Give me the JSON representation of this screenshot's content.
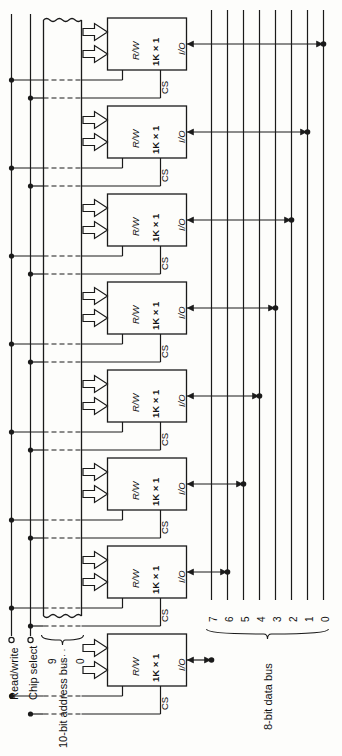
{
  "figure": {
    "orientation": "rotated-90",
    "ink_color": "#1a1a1a",
    "background_color": "#fdfdfb"
  },
  "control_terminals": [
    {
      "id": "read-write",
      "label": "Read/write",
      "terminal": "open-circle"
    },
    {
      "id": "chip-select",
      "label": "Chip select",
      "terminal": "open-circle"
    }
  ],
  "address_bus": {
    "label": "10-bit address bus",
    "width_bits": 10,
    "msb_label": "9",
    "ellipsis_label": "· · · ·",
    "lsb_label": "0",
    "brace": "curly",
    "edge_style": "torn-zigzag"
  },
  "data_bus": {
    "label": "8-bit data bus",
    "width_bits": 8,
    "line_labels": [
      "7",
      "6",
      "5",
      "4",
      "3",
      "2",
      "1",
      "0"
    ],
    "brace": "curly"
  },
  "chips": [
    {
      "index": 1,
      "rw_label": "R/W",
      "size_label": "1K × 1",
      "io_label": "I/O",
      "cs_label": "CS",
      "data_line": "0"
    },
    {
      "index": 2,
      "rw_label": "R/W",
      "size_label": "1K × 1",
      "io_label": "I/O",
      "cs_label": "CS",
      "data_line": "1"
    },
    {
      "index": 3,
      "rw_label": "R/W",
      "size_label": "1K × 1",
      "io_label": "I/O",
      "cs_label": "CS",
      "data_line": "2"
    },
    {
      "index": 4,
      "rw_label": "R/W",
      "size_label": "1K × 1",
      "io_label": "I/O",
      "cs_label": "CS",
      "data_line": "3"
    },
    {
      "index": 5,
      "rw_label": "R/W",
      "size_label": "1K × 1",
      "io_label": "I/O",
      "cs_label": "CS",
      "data_line": "4"
    },
    {
      "index": 6,
      "rw_label": "R/W",
      "size_label": "1K × 1",
      "io_label": "I/O",
      "cs_label": "CS",
      "data_line": "5"
    },
    {
      "index": 7,
      "rw_label": "R/W",
      "size_label": "1K × 1",
      "io_label": "I/O",
      "cs_label": "CS",
      "data_line": "6"
    },
    {
      "index": 8,
      "rw_label": "R/W",
      "size_label": "1K × 1",
      "io_label": "I/O",
      "cs_label": "CS",
      "data_line": "7"
    }
  ]
}
